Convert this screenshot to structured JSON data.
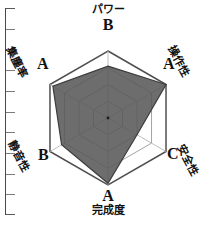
{
  "chart_data": {
    "type": "radar",
    "title": "",
    "categories": [
      "パワー",
      "操作性",
      "安全性",
      "完成度",
      "静音性",
      "集塵率"
    ],
    "grades": [
      "B",
      "A",
      "C",
      "A",
      "B",
      "A"
    ],
    "values": [
      3.1,
      4.0,
      2.0,
      3.9,
      3.2,
      3.8
    ],
    "rmax": 4,
    "rings": 4,
    "grid": true,
    "legend": false,
    "axes": [
      {
        "name": "パワー",
        "grade": "B",
        "value": 3.1,
        "angle_deg": 90
      },
      {
        "name": "操作性",
        "grade": "A",
        "value": 4.0,
        "angle_deg": 30
      },
      {
        "name": "安全性",
        "grade": "C",
        "value": 2.0,
        "angle_deg": -30
      },
      {
        "name": "完成度",
        "grade": "A",
        "value": 3.9,
        "angle_deg": -90
      },
      {
        "name": "静音性",
        "grade": "B",
        "value": 3.2,
        "angle_deg": -150
      },
      {
        "name": "集塵率",
        "grade": "A",
        "value": 3.8,
        "angle_deg": 150
      }
    ],
    "colors": {
      "fill": "#595959",
      "stroke": "#3d3d3d",
      "grid_outer": "#4f4f4f",
      "grid_inner": "#9a9a9a",
      "spoke": "#b5b5b5",
      "text": "#111111"
    }
  },
  "ruler": {
    "present": true,
    "orientation": "vertical",
    "tick_count": 11
  }
}
